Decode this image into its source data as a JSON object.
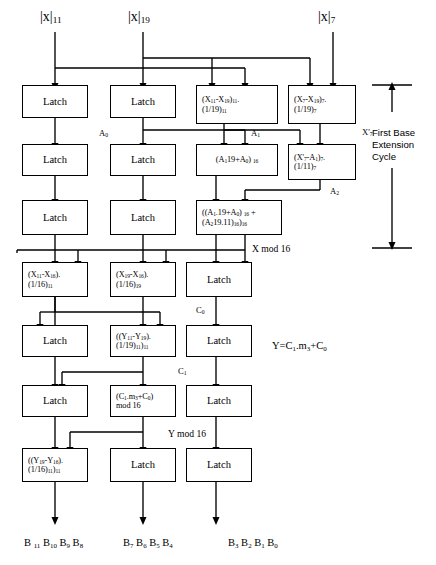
{
  "diagram": {
    "inputs": [
      {
        "name": "input-x-mod-11",
        "text": "|x|11"
      },
      {
        "name": "input-x-mod-19",
        "text": "|x|19"
      },
      {
        "name": "input-x-mod-7",
        "text": "|x|7"
      }
    ],
    "rows": [
      {
        "row": 1,
        "cells": [
          {
            "name": "latch-r1c1",
            "text": "Latch",
            "kind": "latch"
          },
          {
            "name": "latch-r1c2",
            "text": "Latch",
            "kind": "latch"
          },
          {
            "name": "mul-r1c3",
            "text": "(X11-X19)11.(1/19)11",
            "kind": "expr",
            "lines": [
              "(X11-X19)11.",
              "(1/19)11"
            ]
          },
          {
            "name": "mul-r1c4",
            "text": "(X7-X19)7.(1/19)7",
            "kind": "expr",
            "lines": [
              "(X7-X19)7.",
              "(1/19)7"
            ]
          }
        ]
      },
      {
        "row": 2,
        "cells": [
          {
            "name": "latch-r2c1",
            "text": "Latch",
            "kind": "latch"
          },
          {
            "name": "latch-r2c2",
            "text": "Latch",
            "kind": "latch"
          },
          {
            "name": "add-r2c3",
            "text": "(A1 19+A0) 16",
            "kind": "expr",
            "lines": [
              "(A1 19+A0) 16"
            ]
          },
          {
            "name": "mul-r2c4",
            "text": "(X'7-A1)7.(1/11)7",
            "kind": "expr",
            "lines": [
              "(X'7-A1)7.",
              "(1/11)7"
            ]
          }
        ]
      },
      {
        "row": 3,
        "cells": [
          {
            "name": "latch-r3c1",
            "text": "Latch",
            "kind": "latch"
          },
          {
            "name": "latch-r3c2",
            "text": "Latch",
            "kind": "latch"
          },
          {
            "name": "sum-r3c3",
            "text": "((A1.19+A0) 16 + (A2 19.11)16)16",
            "kind": "expr",
            "lines": [
              "((A1.19+A0) 16 +",
              "(A2 19.11)16)16"
            ]
          }
        ]
      },
      {
        "row": 4,
        "cells": [
          {
            "name": "mul-r4c1",
            "text": "(X11-X16).(1/16)11",
            "kind": "expr",
            "lines": [
              "(X11-X16).",
              "(1/16)11"
            ]
          },
          {
            "name": "mul-r4c2",
            "text": "(X19-X16).(1/16)19",
            "kind": "expr",
            "lines": [
              "(X19-X16).",
              "(1/16)19"
            ]
          },
          {
            "name": "latch-r4c3",
            "text": "Latch",
            "kind": "latch"
          }
        ]
      },
      {
        "row": 5,
        "cells": [
          {
            "name": "latch-r5c1",
            "text": "Latch",
            "kind": "latch"
          },
          {
            "name": "mul-r5c2",
            "text": "((Y11-Y19).(1/19)11)11",
            "kind": "expr",
            "lines": [
              "((Y11-Y19).",
              "(1/19)11)11"
            ]
          },
          {
            "name": "latch-r5c3",
            "text": "Latch",
            "kind": "latch"
          }
        ]
      },
      {
        "row": 6,
        "cells": [
          {
            "name": "latch-r6c1",
            "text": "Latch",
            "kind": "latch"
          },
          {
            "name": "mod-r6c2",
            "text": "(C1.m3+C0) mod 16",
            "kind": "expr",
            "lines": [
              "(C1.m3+C0)",
              "mod 16"
            ]
          },
          {
            "name": "latch-r6c3",
            "text": "Latch",
            "kind": "latch"
          }
        ]
      },
      {
        "row": 7,
        "cells": [
          {
            "name": "mul-r7c1",
            "text": "((Y19-Y16).(1/16)11)11",
            "kind": "expr",
            "lines": [
              "((Y19-Y16).",
              "(1/16)11)11"
            ]
          },
          {
            "name": "latch-r7c2",
            "text": "Latch",
            "kind": "latch"
          },
          {
            "name": "latch-r7c3",
            "text": "Latch",
            "kind": "latch"
          }
        ]
      }
    ],
    "signals": [
      {
        "name": "signal-a0",
        "text": "A0"
      },
      {
        "name": "signal-a1",
        "text": "A1"
      },
      {
        "name": "signal-x7-prime",
        "text": "X'7"
      },
      {
        "name": "signal-a2",
        "text": "A2"
      },
      {
        "name": "signal-c0",
        "text": "C0"
      },
      {
        "name": "signal-c1",
        "text": "C1"
      }
    ],
    "bus_labels": [
      {
        "name": "bus-x-mod-16",
        "text": "X mod 16"
      },
      {
        "name": "bus-y-mod-16",
        "text": "Y mod 16"
      }
    ],
    "annotations": [
      {
        "name": "annotation-first-base-extension-cycle",
        "lines": [
          "First Base",
          "Extension",
          "Cycle"
        ]
      },
      {
        "name": "annotation-y-equation",
        "text": "Y=C1.m3+C0"
      }
    ],
    "outputs": [
      {
        "name": "output-bits-11-8",
        "text": "B 11 B10 B9 B8"
      },
      {
        "name": "output-bits-7-4",
        "text": "B7 B6 B5 B4"
      },
      {
        "name": "output-bits-3-0",
        "text": "B3 B2 B1 B0"
      }
    ],
    "colors": {
      "stroke": "#000000",
      "background": "#ffffff"
    }
  }
}
